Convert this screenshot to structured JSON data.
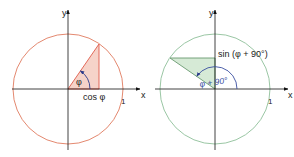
{
  "left_diagram": {
    "axis_x_label": "x",
    "axis_y_label": "y",
    "tick_label": "1",
    "angle_label": "φ",
    "adjacent_side_label": "cos φ",
    "circle_color": "#e07a5f",
    "triangle_fill": "#f6d3c9",
    "triangle_stroke": "#e05a4a"
  },
  "right_diagram": {
    "axis_x_label": "x",
    "axis_y_label": "y",
    "tick_label": "1",
    "angle_label": "φ + 90°",
    "opposite_side_label": "sin (φ + 90°)",
    "circle_color": "#8fbf9a",
    "triangle_fill": "#d6ead6",
    "triangle_stroke": "#6a9a70",
    "arc_color": "#3a4fa0"
  }
}
